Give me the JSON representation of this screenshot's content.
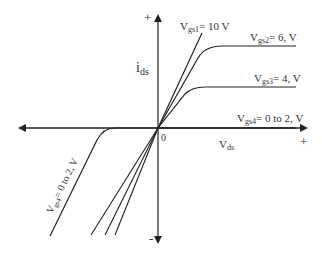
{
  "diagram": {
    "type": "mosfet-iv-characteristics",
    "axes": {
      "y_label_main": "i",
      "y_label_sub": "ds",
      "x_label_main": "V",
      "x_label_sub": "ds",
      "origin_label": "0",
      "y_plus": "+",
      "y_minus": "-",
      "x_plus": "+"
    },
    "curves": [
      {
        "name_main": "V",
        "name_sub": "gs1",
        "value": "= 10  V"
      },
      {
        "name_main": "V",
        "name_sub": "gs2",
        "value": "= 6,  V"
      },
      {
        "name_main": "V",
        "name_sub": "gs3",
        "value": "= 4,  V"
      },
      {
        "name_main": "V",
        "name_sub": "gs4",
        "value": "= 0 to 2,  V"
      }
    ],
    "negative_curve": {
      "name_main": "V",
      "name_sub": "gs4",
      "value": "= 0 to 2,  V"
    },
    "colors": {
      "line": "#222222",
      "text": "#333333",
      "background": "#ffffff"
    }
  }
}
